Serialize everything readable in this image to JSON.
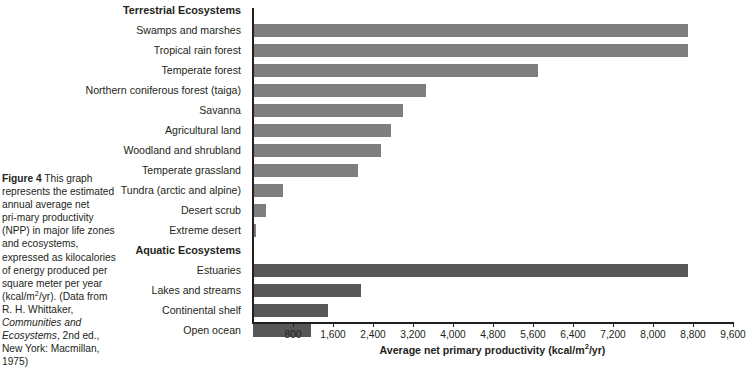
{
  "figure": {
    "label": "Figure 4",
    "caption_part1": " This graph represents the estimated annual average net primary productivity (NPP) in major life zones and ecosystems, expressed as kilocalories of energy produced per square square meter per year (kcal/",
    "caption_line_1": "Figure 4",
    "caption_body_a": "This graph represents the estimated annual average net pri‑mary productivity (NPP) in major life zones and ecosystems, expressed as kilocalories of energy produced per square meter per year (kcal/m",
    "caption_sup": "2",
    "caption_body_b": "/yr). (Data from R. H. Whittaker, ",
    "caption_italic": "Communities and Ecosystems",
    "caption_body_c": ", 2nd ed., New York: Macmillan, 1975)"
  },
  "chart_data": {
    "type": "bar",
    "orientation": "horizontal",
    "title": "",
    "xlabel": "Average net primary productivity (kcal/m2/yr)",
    "ylabel": "",
    "xlim": [
      0,
      9600
    ],
    "grid": false,
    "legend": "none",
    "tick_labels": [
      "800",
      "1,600",
      "2,400",
      "3,200",
      "4,000",
      "4,800",
      "5,600",
      "6,400",
      "7,200",
      "8,000",
      "8,800",
      "9,600"
    ],
    "ticks": [
      800,
      1600,
      2400,
      3200,
      4000,
      4800,
      5600,
      6400,
      7200,
      8000,
      8800,
      9600
    ],
    "colors": {
      "terrestrial": "#7e7e7e",
      "aquatic": "#575757",
      "axis": "#231f20"
    },
    "groups": [
      {
        "name": "Terrestrial Ecosystems",
        "series_key": "terrestrial",
        "categories": [
          "Swamps and marshes",
          "Tropical rain forest",
          "Temperate forest",
          "Northern coniferous forest (taiga)",
          "Savanna",
          "Agricultural land",
          "Woodland and shrubland",
          "Temperate grassland",
          "Tundra (arctic and alpine)",
          "Desert scrub",
          "Extreme desert"
        ],
        "values": [
          8700,
          8700,
          5700,
          3450,
          3000,
          2750,
          2550,
          2100,
          600,
          250,
          60
        ]
      },
      {
        "name": "Aquatic Ecosystems",
        "series_key": "aquatic",
        "categories": [
          "Estuaries",
          "Lakes and streams",
          "Continental shelf",
          "Open ocean"
        ],
        "values": [
          8700,
          2150,
          1500,
          1150
        ]
      }
    ]
  }
}
